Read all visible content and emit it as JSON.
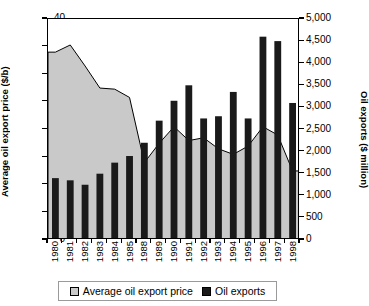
{
  "chart_data": {
    "type": "bar",
    "title": "",
    "subtitle": "",
    "categories": [
      "1980",
      "1981",
      "1982",
      "1983",
      "1984",
      "1985",
      "1988",
      "1989",
      "1990",
      "1991",
      "1992",
      "1993",
      "1994",
      "1995",
      "1996",
      "1997",
      "1998"
    ],
    "series": [
      {
        "name": "Average oil export price",
        "type": "area",
        "axis": "left",
        "unit": "$/b",
        "color": "#c9c9c9",
        "values": [
          34.0,
          35.3,
          31.5,
          27.5,
          27.3,
          25.8,
          14.0,
          17.5,
          20.5,
          18.0,
          18.5,
          16.5,
          15.5,
          17.0,
          20.5,
          19.0,
          12.5
        ]
      },
      {
        "name": "Oil exports",
        "type": "bar",
        "axis": "right",
        "unit": "$ million",
        "color": "#1a1a1a",
        "values": [
          1400,
          1350,
          1250,
          1500,
          1750,
          1900,
          2200,
          2700,
          3150,
          3500,
          2750,
          2800,
          3350,
          2750,
          4600,
          4500,
          3100
        ]
      }
    ],
    "xlabel": "",
    "ylabel": "Average oil export price ($/b)",
    "y2label": "Oil exports ($ million)",
    "ylim": [
      0,
      40
    ],
    "y2lim": [
      0,
      5000
    ],
    "yticks": [
      "0",
      "5",
      "10",
      "15",
      "20",
      "25",
      "30",
      "35",
      "40"
    ],
    "y2ticks": [
      "0",
      "500",
      "1,000",
      "1,500",
      "2,000",
      "2,500",
      "3,000",
      "3,500",
      "4,000",
      "4,500",
      "5,000"
    ],
    "grid": false,
    "legend_position": "bottom"
  },
  "axes": {
    "left_title": "Average oil export price ($/b)",
    "right_title": "Oil exports ($ million)"
  },
  "legend": {
    "items": [
      {
        "label": "Average oil export price",
        "swatch": "area-swatch"
      },
      {
        "label": "Oil exports",
        "swatch": "bar-swatch"
      }
    ]
  }
}
